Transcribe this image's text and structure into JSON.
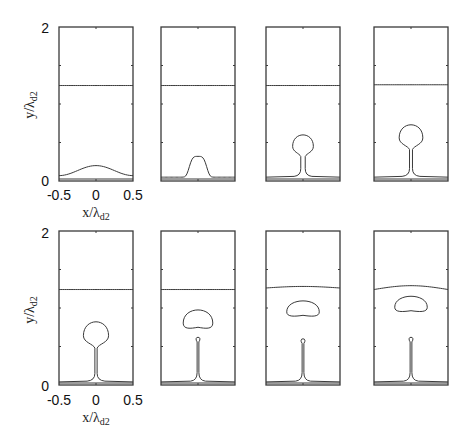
{
  "chart_data": {
    "type": "line",
    "title": "",
    "layout": "2 rows x 4 columns",
    "xlabel": "x/λd2",
    "xlabel_main": "x/λ",
    "xlabel_sub": "d2",
    "ylabel": "y/λd2",
    "ylabel_main": "y/λ",
    "ylabel_sub": "d2",
    "xlim": [
      -0.5,
      0.5
    ],
    "ylim": [
      0,
      2
    ],
    "xticks": [
      "-0.5",
      "0",
      "0.5"
    ],
    "yticks": [
      "0",
      "2"
    ],
    "grid": false,
    "panels": [
      {
        "row": 0,
        "col": 0,
        "upper_interface": 1.24,
        "film": 0.07,
        "shape": "bump",
        "bump_height": 0.2,
        "bump_width": 0.5
      },
      {
        "row": 0,
        "col": 1,
        "upper_interface": 1.24,
        "film": 0.05,
        "shape": "mound",
        "bump_height": 0.32,
        "bump_width": 0.3
      },
      {
        "row": 0,
        "col": 2,
        "upper_interface": 1.24,
        "film": 0.05,
        "shape": "drop-neck",
        "head_center": 0.45,
        "head_radius": 0.14,
        "neck_width": 0.03
      },
      {
        "row": 0,
        "col": 3,
        "upper_interface": 1.25,
        "film": 0.05,
        "shape": "drop-neck",
        "head_center": 0.56,
        "head_radius": 0.16,
        "neck_width": 0.02
      },
      {
        "row": 1,
        "col": 0,
        "upper_interface": 1.24,
        "film": 0.04,
        "shape": "drop-neck",
        "head_center": 0.64,
        "head_radius": 0.17,
        "neck_width": 0.015
      },
      {
        "row": 1,
        "col": 1,
        "upper_interface": 1.24,
        "film": 0.04,
        "shape": "detached",
        "bubble_center": 0.84,
        "bubble_rx": 0.2,
        "bubble_ry": 0.12,
        "jet_top": 0.62
      },
      {
        "row": 1,
        "col": 2,
        "upper_interface": 1.26,
        "film": 0.04,
        "shape": "detached",
        "bubble_center": 0.98,
        "bubble_rx": 0.22,
        "bubble_ry": 0.1,
        "jet_top": 0.6,
        "interface_hump": 0.02
      },
      {
        "row": 1,
        "col": 3,
        "upper_interface": 1.24,
        "film": 0.04,
        "shape": "detached",
        "bubble_center": 1.04,
        "bubble_rx": 0.22,
        "bubble_ry": 0.1,
        "jet_top": 0.62,
        "interface_hump": 0.05
      }
    ]
  }
}
